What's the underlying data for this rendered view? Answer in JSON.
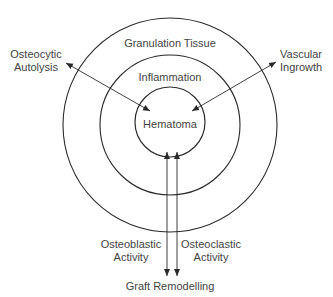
{
  "diagram": {
    "rings": [
      {
        "label": "Granulation Tissue",
        "cx": 170,
        "cy": 125,
        "r": 107
      },
      {
        "label": "Inflammation",
        "cx": 170,
        "cy": 125,
        "r": 70
      },
      {
        "label": "Hematoma",
        "cx": 170,
        "cy": 122,
        "r": 35
      }
    ],
    "arrows": [
      {
        "label": "Osteocytic Autolysis",
        "line1": "Osteocytic",
        "line2": "Autolysis",
        "direction": "bidirectional"
      },
      {
        "label": "Vascular Ingrowth",
        "line1": "Vascular",
        "line2": "Ingrowth",
        "direction": "bidirectional"
      },
      {
        "label": "Osteoblastic Activity",
        "line1": "Osteoblastic",
        "line2": "Activity",
        "direction": "bidirectional"
      },
      {
        "label": "Osteoclastic Activity",
        "line1": "Osteoclastic",
        "line2": "Activity",
        "direction": "bidirectional"
      }
    ],
    "bottom_label": "Graft Remodelling",
    "line_color": "#2a2a2a"
  }
}
